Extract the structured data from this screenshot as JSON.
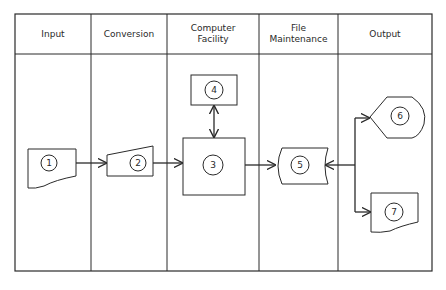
{
  "diagram": {
    "type": "system flowchart",
    "columns": [
      {
        "id": "input",
        "label": "Input"
      },
      {
        "id": "conversion",
        "label": "Conversion"
      },
      {
        "id": "computer",
        "label": "Computer\nFacility"
      },
      {
        "id": "file",
        "label": "File\nMaintenance"
      },
      {
        "id": "output",
        "label": "Output"
      }
    ],
    "nodes": [
      {
        "id": "1",
        "label": "1",
        "shape": "manual-input-document",
        "column": "Input"
      },
      {
        "id": "2",
        "label": "2",
        "shape": "manual-operation-trapezoid",
        "column": "Conversion"
      },
      {
        "id": "3",
        "label": "3",
        "shape": "process-box",
        "column": "Computer Facility"
      },
      {
        "id": "4",
        "label": "4",
        "shape": "process-box",
        "column": "Computer Facility"
      },
      {
        "id": "5",
        "label": "5",
        "shape": "stored-data",
        "column": "File Maintenance"
      },
      {
        "id": "6",
        "label": "6",
        "shape": "display",
        "column": "Output"
      },
      {
        "id": "7",
        "label": "7",
        "shape": "document",
        "column": "Output"
      }
    ],
    "edges": [
      {
        "from": "1",
        "to": "2",
        "direction": "forward"
      },
      {
        "from": "2",
        "to": "3",
        "direction": "forward"
      },
      {
        "from": "3",
        "to": "4",
        "direction": "bidirectional"
      },
      {
        "from": "3",
        "to": "5",
        "direction": "forward"
      },
      {
        "from": "6",
        "to": "5",
        "direction": "branch",
        "note": "5 feeds 6 and 7 with arrow back into 5"
      },
      {
        "from": "branch",
        "to": "6",
        "direction": "forward"
      },
      {
        "from": "branch",
        "to": "7",
        "direction": "forward"
      }
    ]
  },
  "colors": {
    "line": "#2a2a2a",
    "background": "#ffffff"
  }
}
